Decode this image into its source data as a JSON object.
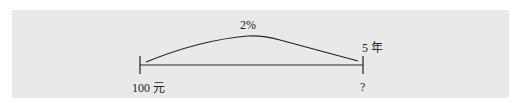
{
  "diagram": {
    "rate_label": "2%",
    "period_label": "5 年",
    "principal_label": "100 元",
    "future_value_label": "?",
    "colors": {
      "background": "#e9e9e9",
      "line": "#222222"
    }
  }
}
